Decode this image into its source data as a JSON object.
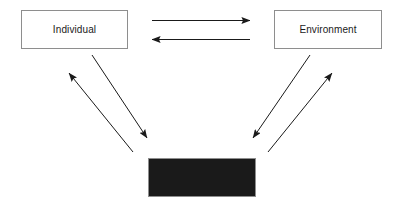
{
  "diagram": {
    "type": "cycle-diagram",
    "background_color": "#ffffff",
    "nodes": [
      {
        "id": "individual",
        "label": "Individual",
        "x": 21,
        "y": 10,
        "width": 107,
        "height": 39,
        "border_color": "#8e8e8e",
        "fill_color": "#ffffff",
        "text_color": "#1a1a1a"
      },
      {
        "id": "environment",
        "label": "Environment",
        "x": 274,
        "y": 10,
        "width": 108,
        "height": 39,
        "border_color": "#8e8e8e",
        "fill_color": "#ffffff",
        "text_color": "#1a1a1a"
      },
      {
        "id": "behaviour",
        "label": "Behaviour",
        "x": 148,
        "y": 158,
        "width": 108,
        "height": 39,
        "border_color": "#8e8e8e",
        "fill_color": "#1a1a1a",
        "text_color": "#1a1a1a"
      }
    ],
    "edges": [
      {
        "id": "individual-to-environment",
        "from": "individual",
        "to": "environment",
        "x1": 152,
        "y1": 20.5,
        "x2": 250,
        "y2": 20.5,
        "color": "#1a1a1a",
        "width": 1,
        "arrowhead": "end"
      },
      {
        "id": "environment-to-individual",
        "from": "environment",
        "to": "individual",
        "x1": 250,
        "y1": 39.5,
        "x2": 152,
        "y2": 39.5,
        "color": "#1a1a1a",
        "width": 1,
        "arrowhead": "end"
      },
      {
        "id": "behaviour-to-individual",
        "from": "behaviour",
        "to": "individual",
        "x1": 133,
        "y1": 152,
        "x2": 69,
        "y2": 73,
        "color": "#1a1a1a",
        "width": 1,
        "arrowhead": "end"
      },
      {
        "id": "individual-to-behaviour",
        "from": "individual",
        "to": "behaviour",
        "x1": 92,
        "y1": 55,
        "x2": 147,
        "y2": 138,
        "color": "#1a1a1a",
        "width": 1,
        "arrowhead": "end"
      },
      {
        "id": "behaviour-to-environment",
        "from": "behaviour",
        "to": "environment",
        "x1": 268,
        "y1": 152,
        "x2": 332,
        "y2": 73,
        "color": "#1a1a1a",
        "width": 1,
        "arrowhead": "end"
      },
      {
        "id": "environment-to-behaviour",
        "from": "environment",
        "to": "behaviour",
        "x1": 310,
        "y1": 55,
        "x2": 253,
        "y2": 138,
        "color": "#1a1a1a",
        "width": 1,
        "arrowhead": "end"
      }
    ]
  }
}
